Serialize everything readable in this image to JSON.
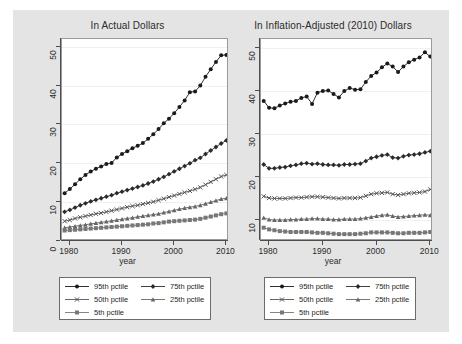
{
  "figure": {
    "background": "#e4e4e4",
    "plot_background": "#ffffff"
  },
  "axis": {
    "xlabel": "year",
    "x_ticks": [
      "1980",
      "1990",
      "2000",
      "2010"
    ],
    "y_ticks_left": [
      "0",
      "10",
      "20",
      "30",
      "40",
      "50"
    ],
    "y_ticks_right": [
      "10",
      "20",
      "30",
      "40",
      "50"
    ]
  },
  "legend": {
    "entries": [
      {
        "label": "95th pctile",
        "marker": "circle",
        "color": "#1a1a1a"
      },
      {
        "label": "75th pctile",
        "marker": "diamond",
        "color": "#2b2b2b"
      },
      {
        "label": "50th pctile",
        "marker": "x",
        "color": "#555555"
      },
      {
        "label": "25th pctile",
        "marker": "triangle",
        "color": "#666666"
      },
      {
        "label": "5th pctile",
        "marker": "square",
        "color": "#777777"
      }
    ]
  },
  "chart_data": [
    {
      "type": "line",
      "title": "In Actual Dollars",
      "xlabel": "year",
      "ylabel": "",
      "xlim": [
        1978.5,
        2010.5
      ],
      "ylim": [
        0,
        52
      ],
      "xticks": [
        1980,
        1990,
        2000,
        2010
      ],
      "yticks": [
        0,
        10,
        20,
        30,
        40,
        50
      ],
      "grid": true,
      "legend_position": "below",
      "x": [
        1979,
        1980,
        1981,
        1982,
        1983,
        1984,
        1985,
        1986,
        1987,
        1988,
        1989,
        1990,
        1991,
        1992,
        1993,
        1994,
        1995,
        1996,
        1997,
        1998,
        1999,
        2000,
        2001,
        2002,
        2003,
        2004,
        2005,
        2006,
        2007,
        2008,
        2009,
        2010
      ],
      "series": [
        {
          "name": "95th pctile",
          "marker": "circle",
          "color": "#1a1a1a",
          "values": [
            12.3,
            13.4,
            14.6,
            15.9,
            17.0,
            17.9,
            18.6,
            19.2,
            19.8,
            20.1,
            21.5,
            22.4,
            23.1,
            23.9,
            24.5,
            25.2,
            26.3,
            27.5,
            28.8,
            30.3,
            31.5,
            32.9,
            34.5,
            36.2,
            38.3,
            38.5,
            40.0,
            42.3,
            44.2,
            46.1,
            47.8,
            47.9
          ]
        },
        {
          "name": "75th pctile",
          "marker": "diamond",
          "color": "#2b2b2b",
          "values": [
            7.5,
            8.0,
            8.6,
            9.2,
            9.7,
            10.2,
            10.6,
            11.0,
            11.4,
            11.8,
            12.3,
            12.7,
            13.1,
            13.5,
            13.9,
            14.3,
            14.8,
            15.3,
            15.9,
            16.5,
            17.2,
            17.9,
            18.6,
            19.3,
            20.0,
            20.8,
            21.4,
            22.4,
            23.3,
            24.2,
            25.1,
            25.9
          ]
        },
        {
          "name": "50th pctile",
          "marker": "x",
          "color": "#555555",
          "values": [
            5.1,
            5.4,
            5.8,
            6.1,
            6.4,
            6.7,
            7.0,
            7.2,
            7.5,
            7.8,
            8.1,
            8.4,
            8.7,
            9.0,
            9.2,
            9.5,
            9.8,
            10.1,
            10.5,
            10.9,
            11.3,
            11.7,
            12.1,
            12.5,
            12.9,
            13.3,
            13.8,
            14.5,
            15.2,
            15.9,
            16.6,
            17.0
          ]
        },
        {
          "name": "25th pctile",
          "marker": "triangle",
          "color": "#666666",
          "values": [
            3.4,
            3.6,
            3.8,
            4.0,
            4.2,
            4.4,
            4.6,
            4.8,
            5.0,
            5.2,
            5.4,
            5.6,
            5.8,
            6.0,
            6.2,
            6.4,
            6.6,
            6.8,
            7.0,
            7.3,
            7.6,
            7.9,
            8.2,
            8.5,
            8.7,
            8.9,
            9.2,
            9.6,
            10.0,
            10.4,
            10.8,
            11.0
          ]
        },
        {
          "name": "5th pctile",
          "marker": "square",
          "color": "#777777",
          "values": [
            2.7,
            2.8,
            2.9,
            3.0,
            3.1,
            3.2,
            3.3,
            3.4,
            3.5,
            3.6,
            3.7,
            3.8,
            3.9,
            4.0,
            4.1,
            4.2,
            4.3,
            4.5,
            4.6,
            4.8,
            5.0,
            5.1,
            5.2,
            5.3,
            5.4,
            5.5,
            5.7,
            6.0,
            6.3,
            6.6,
            6.9,
            7.1
          ]
        }
      ]
    },
    {
      "type": "line",
      "title": "In Inflation-Adjusted (2010) Dollars",
      "xlabel": "year",
      "ylabel": "",
      "xlim": [
        1978.5,
        2010.5
      ],
      "ylim": [
        5,
        52
      ],
      "xticks": [
        1980,
        1990,
        2000,
        2010
      ],
      "yticks": [
        10,
        20,
        30,
        40,
        50
      ],
      "grid": true,
      "legend_position": "below",
      "x": [
        1979,
        1980,
        1981,
        1982,
        1983,
        1984,
        1985,
        1986,
        1987,
        1988,
        1989,
        1990,
        1991,
        1992,
        1993,
        1994,
        1995,
        1996,
        1997,
        1998,
        1999,
        2000,
        2001,
        2002,
        2003,
        2004,
        2005,
        2006,
        2007,
        2008,
        2009,
        2010
      ],
      "series": [
        {
          "name": "95th pctile",
          "marker": "circle",
          "color": "#1a1a1a",
          "values": [
            37.6,
            36.0,
            35.9,
            36.5,
            37.0,
            37.4,
            37.6,
            38.3,
            38.6,
            36.9,
            39.5,
            39.9,
            40.0,
            39.2,
            38.4,
            39.9,
            40.6,
            40.2,
            40.3,
            42.0,
            43.4,
            44.2,
            45.4,
            46.3,
            45.6,
            44.3,
            45.6,
            46.6,
            47.2,
            47.7,
            48.9,
            47.9
          ]
        },
        {
          "name": "75th pctile",
          "marker": "diamond",
          "color": "#2b2b2b",
          "values": [
            22.8,
            21.9,
            21.9,
            22.1,
            22.2,
            22.5,
            22.7,
            23.0,
            23.1,
            22.9,
            23.0,
            22.8,
            22.7,
            22.7,
            22.6,
            22.8,
            22.8,
            22.9,
            23.0,
            23.6,
            24.3,
            24.6,
            24.9,
            25.1,
            24.4,
            24.3,
            24.7,
            25.0,
            25.1,
            25.3,
            25.6,
            25.9
          ]
        },
        {
          "name": "50th pctile",
          "marker": "x",
          "color": "#555555",
          "values": [
            15.4,
            15.0,
            14.9,
            14.9,
            14.9,
            15.0,
            15.1,
            15.1,
            15.2,
            15.3,
            15.3,
            15.2,
            15.1,
            15.0,
            14.9,
            15.0,
            15.0,
            15.0,
            15.1,
            15.5,
            15.9,
            16.1,
            16.2,
            16.3,
            15.9,
            15.7,
            15.9,
            16.1,
            16.2,
            16.3,
            16.5,
            17.0
          ]
        },
        {
          "name": "25th pctile",
          "marker": "triangle",
          "color": "#666666",
          "values": [
            10.4,
            10.0,
            9.9,
            9.9,
            9.9,
            10.0,
            10.0,
            10.1,
            10.1,
            10.2,
            10.2,
            10.1,
            10.1,
            10.0,
            10.0,
            10.1,
            10.1,
            10.1,
            10.2,
            10.4,
            10.6,
            10.8,
            11.0,
            11.1,
            10.8,
            10.6,
            10.7,
            10.8,
            10.9,
            11.0,
            11.1,
            11.0
          ]
        },
        {
          "name": "5th pctile",
          "marker": "square",
          "color": "#777777",
          "values": [
            8.1,
            7.7,
            7.5,
            7.3,
            7.2,
            7.1,
            7.1,
            7.1,
            7.1,
            7.0,
            6.9,
            6.9,
            6.8,
            6.7,
            6.6,
            6.6,
            6.6,
            6.6,
            6.7,
            6.8,
            7.0,
            7.0,
            7.0,
            7.0,
            6.9,
            6.8,
            6.8,
            6.9,
            6.9,
            6.9,
            7.0,
            7.1
          ]
        }
      ]
    }
  ]
}
